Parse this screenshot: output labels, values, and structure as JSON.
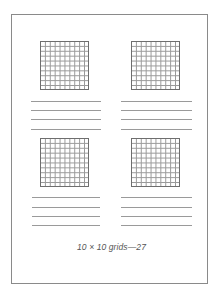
{
  "page": {
    "caption": "10 × 10 grids—27",
    "grid_rows": 10,
    "grid_cols": 10,
    "grid_count": 4,
    "answer_lines_per_grid": 4
  },
  "colors": {
    "frame": "#8a8a8a",
    "grid_line": "#9a9a9a",
    "rule_line": "#9a9a9a",
    "caption": "#555555"
  },
  "panels": [
    {
      "position": "top-left"
    },
    {
      "position": "top-right"
    },
    {
      "position": "bottom-left"
    },
    {
      "position": "bottom-right"
    }
  ]
}
